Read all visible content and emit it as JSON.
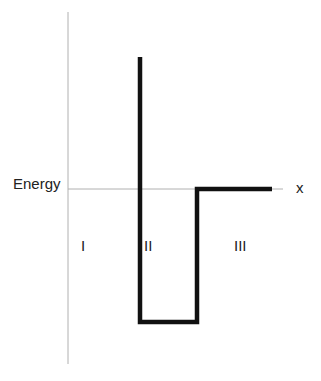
{
  "diagram": {
    "type": "potential-well",
    "axis_labels": {
      "y": "Energy",
      "x": "x"
    },
    "regions": [
      {
        "label": "I"
      },
      {
        "label": "II"
      },
      {
        "label": "III"
      }
    ],
    "colors": {
      "axis": "#b0b0b0",
      "potential": "#111111",
      "text": "#222222"
    },
    "potential_path": [
      {
        "x": 140,
        "y": 57
      },
      {
        "x": 140,
        "y": 322
      },
      {
        "x": 197,
        "y": 322
      },
      {
        "x": 197,
        "y": 189
      },
      {
        "x": 272,
        "y": 189
      }
    ]
  }
}
